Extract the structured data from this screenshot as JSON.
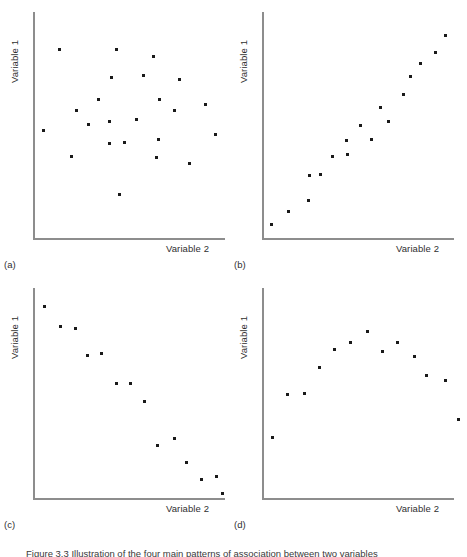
{
  "figure": {
    "caption": "Figure 3.3  Illustration of the four main patterns of association between two variables",
    "axis_color": "#8d8d8d",
    "marker_color": "#1a1a1a",
    "background": "#ffffff"
  },
  "panels": [
    {
      "letter": "(a)",
      "ylabel": "Variable 1",
      "xlabel": "Variable 2",
      "pattern": "no association"
    },
    {
      "letter": "(b)",
      "ylabel": "Variable 1",
      "xlabel": "Variable 2",
      "pattern": "positive linear association"
    },
    {
      "letter": "(c)",
      "ylabel": "Variable 1",
      "xlabel": "Variable 2",
      "pattern": "negative linear association"
    },
    {
      "letter": "(d)",
      "ylabel": "Variable 1",
      "xlabel": "Variable 2",
      "pattern": "curvilinear association"
    }
  ],
  "chart_data": [
    {
      "type": "scatter",
      "id": "a",
      "title": "(a)",
      "xlabel": "Variable 2",
      "ylabel": "Variable 1",
      "xlim": [
        0,
        100
      ],
      "ylim": [
        0,
        100
      ],
      "grid": false,
      "legend": null,
      "points": [
        {
          "x": 12.3,
          "y": 84.4
        },
        {
          "x": 42.9,
          "y": 84.4
        },
        {
          "x": 40.2,
          "y": 71.4
        },
        {
          "x": 62.4,
          "y": 81.0
        },
        {
          "x": 32.8,
          "y": 61.4
        },
        {
          "x": 21.2,
          "y": 56.4
        },
        {
          "x": 57.1,
          "y": 72.4
        },
        {
          "x": 76.7,
          "y": 70.9
        },
        {
          "x": 66.1,
          "y": 61.4
        },
        {
          "x": 39.2,
          "y": 51.4
        },
        {
          "x": 74.1,
          "y": 56.4
        },
        {
          "x": 39.2,
          "y": 41.4
        },
        {
          "x": 90.5,
          "y": 59.4
        },
        {
          "x": 3.7,
          "y": 47.4
        },
        {
          "x": 65.1,
          "y": 43.4
        },
        {
          "x": 95.8,
          "y": 45.9
        },
        {
          "x": 27.5,
          "y": 50.4
        },
        {
          "x": 53.4,
          "y": 52.4
        },
        {
          "x": 47.1,
          "y": 41.9
        },
        {
          "x": 18.5,
          "y": 35.9
        },
        {
          "x": 64.0,
          "y": 35.4
        },
        {
          "x": 82.0,
          "y": 32.4
        },
        {
          "x": 44.4,
          "y": 18.6
        }
      ]
    },
    {
      "type": "scatter",
      "id": "b",
      "title": "(b)",
      "xlabel": "Variable 2",
      "ylabel": "Variable 1",
      "xlim": [
        0,
        100
      ],
      "ylim": [
        0,
        100
      ],
      "grid": false,
      "legend": null,
      "points": [
        {
          "x": 2.8,
          "y": 5.0
        },
        {
          "x": 12.2,
          "y": 10.5
        },
        {
          "x": 22.8,
          "y": 15.5
        },
        {
          "x": 23.3,
          "y": 27.0
        },
        {
          "x": 29.4,
          "y": 27.5
        },
        {
          "x": 35.6,
          "y": 35.5
        },
        {
          "x": 43.9,
          "y": 36.5
        },
        {
          "x": 43.3,
          "y": 43.0
        },
        {
          "x": 50.6,
          "y": 50.0
        },
        {
          "x": 56.7,
          "y": 43.5
        },
        {
          "x": 61.7,
          "y": 58.0
        },
        {
          "x": 65.6,
          "y": 51.5
        },
        {
          "x": 73.9,
          "y": 64.0
        },
        {
          "x": 77.8,
          "y": 72.0
        },
        {
          "x": 83.3,
          "y": 78.0
        },
        {
          "x": 91.1,
          "y": 83.0
        },
        {
          "x": 96.7,
          "y": 90.5
        }
      ]
    },
    {
      "type": "scatter",
      "id": "c",
      "title": "(c)",
      "xlabel": "Variable 2",
      "ylabel": "Variable 1",
      "xlim": [
        0,
        100
      ],
      "ylim": [
        0,
        100
      ],
      "grid": false,
      "legend": null,
      "points": [
        {
          "x": 4.1,
          "y": 92.3
        },
        {
          "x": 12.9,
          "y": 82.6
        },
        {
          "x": 20.6,
          "y": 81.4
        },
        {
          "x": 27.3,
          "y": 68.3
        },
        {
          "x": 34.5,
          "y": 69.4
        },
        {
          "x": 42.8,
          "y": 54.6
        },
        {
          "x": 50.5,
          "y": 54.6
        },
        {
          "x": 57.7,
          "y": 46.0
        },
        {
          "x": 64.9,
          "y": 24.3
        },
        {
          "x": 73.7,
          "y": 27.7
        },
        {
          "x": 80.4,
          "y": 15.7
        },
        {
          "x": 88.7,
          "y": 7.7
        },
        {
          "x": 96.4,
          "y": 8.9
        },
        {
          "x": 99.5,
          "y": 0.9
        }
      ]
    },
    {
      "type": "scatter",
      "id": "d",
      "title": "(d)",
      "xlabel": "Variable 2",
      "ylabel": "Variable 1",
      "xlim": [
        0,
        100
      ],
      "ylim": [
        0,
        100
      ],
      "grid": false,
      "legend": null,
      "points": [
        {
          "x": 3.7,
          "y": 28.1
        },
        {
          "x": 11.7,
          "y": 49.2
        },
        {
          "x": 20.9,
          "y": 49.7
        },
        {
          "x": 28.8,
          "y": 62.6
        },
        {
          "x": 36.8,
          "y": 71.4
        },
        {
          "x": 45.4,
          "y": 75.0
        },
        {
          "x": 54.6,
          "y": 80.1
        },
        {
          "x": 62.6,
          "y": 70.3
        },
        {
          "x": 70.6,
          "y": 75.0
        },
        {
          "x": 79.8,
          "y": 67.8
        },
        {
          "x": 86.5,
          "y": 58.5
        },
        {
          "x": 96.3,
          "y": 55.9
        },
        {
          "x": 103.7,
          "y": 36.9
        },
        {
          "x": 114.1,
          "y": 20.9
        }
      ]
    }
  ]
}
